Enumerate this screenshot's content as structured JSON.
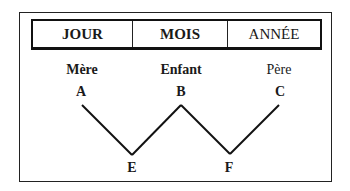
{
  "header": {
    "cells": [
      "JOUR",
      "MOIS",
      "ANNÉE"
    ]
  },
  "roles": {
    "mere": "Mère",
    "enfant": "Enfant",
    "pere": "Père"
  },
  "points": {
    "A": "A",
    "B": "B",
    "C": "C",
    "E": "E",
    "F": "F"
  },
  "path_order": [
    "A",
    "E",
    "B",
    "F",
    "C"
  ]
}
